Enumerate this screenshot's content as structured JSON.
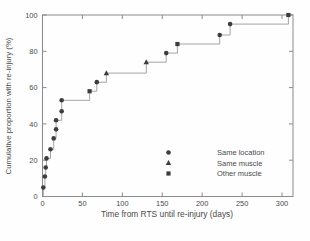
{
  "chart_data": {
    "type": "line",
    "line_style": "step-post",
    "title": "",
    "xlabel": "Time from RTS until re-injury (days)",
    "ylabel": "Cumulative proportion with re-injury (%)",
    "xlim": [
      0,
      313
    ],
    "ylim": [
      0,
      100
    ],
    "x_ticks": [
      0,
      50,
      100,
      150,
      200,
      250,
      300
    ],
    "y_ticks": [
      0,
      20,
      40,
      60,
      80,
      100
    ],
    "grid": false,
    "legend_position": "inside lower-right",
    "legend": [
      {
        "label": "Same location",
        "marker": "circle"
      },
      {
        "label": "Same muscle",
        "marker": "triangle"
      },
      {
        "label": "Other muscle",
        "marker": "square"
      }
    ],
    "points": [
      {
        "x": 1,
        "y": 5,
        "marker": "circle"
      },
      {
        "x": 3,
        "y": 11,
        "marker": "circle"
      },
      {
        "x": 4,
        "y": 16,
        "marker": "circle"
      },
      {
        "x": 5,
        "y": 21,
        "marker": "circle"
      },
      {
        "x": 10,
        "y": 26,
        "marker": "circle"
      },
      {
        "x": 14,
        "y": 32,
        "marker": "circle"
      },
      {
        "x": 17,
        "y": 37,
        "marker": "circle"
      },
      {
        "x": 17,
        "y": 42,
        "marker": "circle"
      },
      {
        "x": 24,
        "y": 47,
        "marker": "circle"
      },
      {
        "x": 24,
        "y": 53,
        "marker": "circle"
      },
      {
        "x": 59,
        "y": 58,
        "marker": "square"
      },
      {
        "x": 68,
        "y": 63,
        "marker": "circle"
      },
      {
        "x": 80,
        "y": 68,
        "marker": "triangle"
      },
      {
        "x": 130,
        "y": 74,
        "marker": "triangle"
      },
      {
        "x": 155,
        "y": 79,
        "marker": "circle"
      },
      {
        "x": 169,
        "y": 84,
        "marker": "square"
      },
      {
        "x": 222,
        "y": 89,
        "marker": "circle"
      },
      {
        "x": 235,
        "y": 95,
        "marker": "circle"
      },
      {
        "x": 308,
        "y": 100,
        "marker": "square"
      }
    ],
    "colors": {
      "marker": "#3d3d3d",
      "line": "#9a9a9a",
      "frame": "#8a8a8a",
      "text": "#4a4a4a"
    }
  }
}
